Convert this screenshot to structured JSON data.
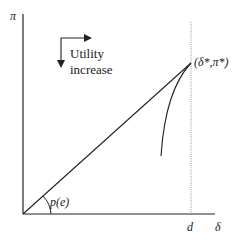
{
  "diagram": {
    "y_axis_label": "π",
    "x_axis_label": "δ",
    "x_tick_label": "d",
    "point_label": "(δ*,π*)",
    "angle_label": "p(e)",
    "utility_text_line1": "Utility",
    "utility_text_line2": "increase",
    "colors": {
      "stroke": "#222222",
      "dotted": "#888888",
      "background": "#ffffff"
    }
  }
}
